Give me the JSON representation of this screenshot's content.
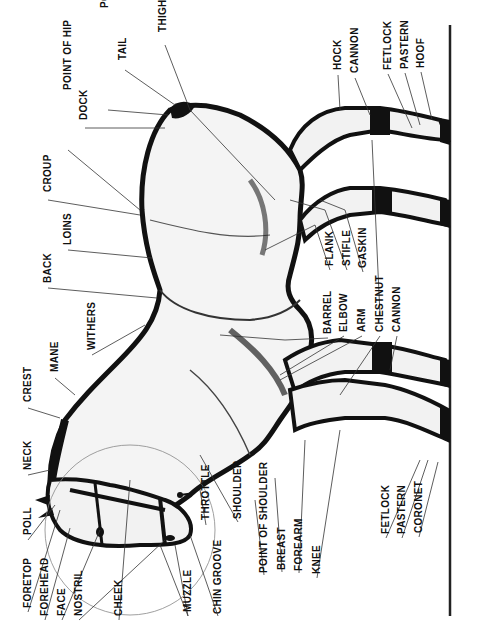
{
  "diagram": {
    "orientation": "rotated 90° counter-clockwise",
    "ground_line": {
      "x": 450,
      "y_top": 25,
      "y_bottom": 616
    },
    "labels": [
      {
        "id": "thigh",
        "text": "THIGH",
        "x": 163,
        "y": 32
      },
      {
        "id": "tail",
        "text": "TAIL",
        "x": 123,
        "y": 60
      },
      {
        "id": "point-of-buttock",
        "text": "POINT OF BUTTOCK",
        "x": 105,
        "y": 8
      },
      {
        "id": "dock",
        "text": "DOCK",
        "x": 84,
        "y": 120
      },
      {
        "id": "point-of-hip",
        "text": "POINT OF HIP",
        "x": 68,
        "y": 90
      },
      {
        "id": "croup",
        "text": "CROUP",
        "x": 48,
        "y": 192
      },
      {
        "id": "loins",
        "text": "LOINS",
        "x": 68,
        "y": 245
      },
      {
        "id": "back",
        "text": "BACK",
        "x": 48,
        "y": 283
      },
      {
        "id": "withers",
        "text": "WITHERS",
        "x": 92,
        "y": 350
      },
      {
        "id": "mane",
        "text": "MANE",
        "x": 55,
        "y": 372
      },
      {
        "id": "crest",
        "text": "CREST",
        "x": 28,
        "y": 402
      },
      {
        "id": "neck",
        "text": "NECK",
        "x": 28,
        "y": 470
      },
      {
        "id": "poll",
        "text": "POLL",
        "x": 28,
        "y": 535
      },
      {
        "id": "foretop",
        "text": "FORETOP",
        "x": 28,
        "y": 608
      },
      {
        "id": "forehead",
        "text": "FOREHEAD",
        "x": 45,
        "y": 616
      },
      {
        "id": "face",
        "text": "FACE",
        "x": 62,
        "y": 616
      },
      {
        "id": "nostril",
        "text": "NOSTRIL",
        "x": 79,
        "y": 616
      },
      {
        "id": "cheek",
        "text": "CHEEK",
        "x": 119,
        "y": 616
      },
      {
        "id": "muzzle",
        "text": "MUZZLE",
        "x": 188,
        "y": 612
      },
      {
        "id": "chin-groove",
        "text": "CHIN GROOVE",
        "x": 218,
        "y": 614
      },
      {
        "id": "throttle",
        "text": "THROTTLE",
        "x": 206,
        "y": 520
      },
      {
        "id": "shoulder",
        "text": "SHOULDER",
        "x": 238,
        "y": 519
      },
      {
        "id": "point-of-shoulder",
        "text": "POINT OF SHOULDER",
        "x": 264,
        "y": 573
      },
      {
        "id": "breast",
        "text": "BREAST",
        "x": 282,
        "y": 570
      },
      {
        "id": "forearm",
        "text": "FOREARM",
        "x": 299,
        "y": 571
      },
      {
        "id": "knee",
        "text": "KNEE",
        "x": 317,
        "y": 574
      },
      {
        "id": "fetlock-front",
        "text": "FETLOCK",
        "x": 386,
        "y": 534
      },
      {
        "id": "pastern-front",
        "text": "PASTERN",
        "x": 402,
        "y": 534
      },
      {
        "id": "coronet",
        "text": "CORONET",
        "x": 419,
        "y": 533
      },
      {
        "id": "barrel",
        "text": "BARREL",
        "x": 328,
        "y": 334
      },
      {
        "id": "elbow",
        "text": "ELBOW",
        "x": 344,
        "y": 332
      },
      {
        "id": "arm",
        "text": "ARM",
        "x": 362,
        "y": 332
      },
      {
        "id": "chestnut",
        "text": "CHESTNUT",
        "x": 380,
        "y": 332
      },
      {
        "id": "cannon-front",
        "text": "CANNON",
        "x": 397,
        "y": 332
      },
      {
        "id": "flank",
        "text": "FLANK",
        "x": 330,
        "y": 266
      },
      {
        "id": "stifle",
        "text": "STIFLE",
        "x": 347,
        "y": 266
      },
      {
        "id": "gaskin",
        "text": "GASKIN",
        "x": 363,
        "y": 268
      },
      {
        "id": "hock",
        "text": "HOCK",
        "x": 338,
        "y": 70
      },
      {
        "id": "cannon-rear",
        "text": "CANNON",
        "x": 355,
        "y": 73
      },
      {
        "id": "fetlock-rear",
        "text": "FETLOCK",
        "x": 388,
        "y": 70
      },
      {
        "id": "pastern-rear",
        "text": "PASTERN",
        "x": 405,
        "y": 69
      },
      {
        "id": "hoof",
        "text": "HOOF",
        "x": 421,
        "y": 68
      }
    ]
  }
}
